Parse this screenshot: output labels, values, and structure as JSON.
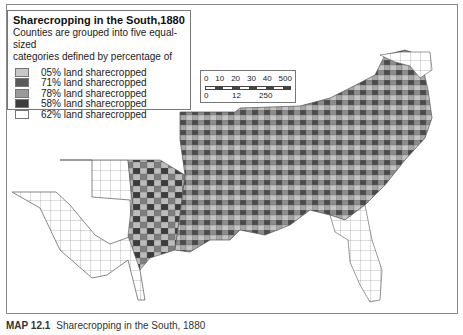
{
  "legend": {
    "title": "Sharecropping in the South,1880",
    "description_line1": "Counties are grouped into five equal-sized",
    "description_line2": "categories defined by percentage of",
    "items": [
      {
        "label": "05% land sharecropped",
        "color": "#c8c8c8"
      },
      {
        "label": "71% land sharecropped",
        "color": "#5a5a5a"
      },
      {
        "label": "78% land sharecropped",
        "color": "#9a9a9a"
      },
      {
        "label": "58% land sharecropped",
        "color": "#3e3e3e"
      },
      {
        "label": "58% land sharecropped",
        "color": "#b0b0b0"
      },
      {
        "label": "62% land sharecropped",
        "color": "#ffffff"
      }
    ]
  },
  "scale": {
    "top_ticks": [
      "0",
      "10",
      "20",
      "30",
      "40",
      "500"
    ],
    "bottom_ticks": [
      "0",
      "12",
      "250"
    ]
  },
  "caption": {
    "label": "MAP 12.1",
    "text": "Sharecropping in the South, 1880"
  },
  "colors": {
    "county_border": "#6a6a6a",
    "dark": "#3e3e3e",
    "medium_dark": "#5a5a5a",
    "medium": "#9a9a9a",
    "light": "#b8b8b8",
    "lightest": "#d2d2d2",
    "none": "#ffffff"
  }
}
